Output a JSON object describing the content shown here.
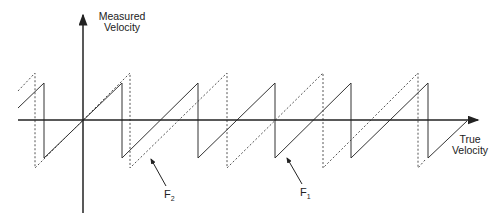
{
  "diagram": {
    "y_axis_label_line1": "Measured",
    "y_axis_label_line2": "Velocity",
    "x_axis_label_line1": "True",
    "x_axis_label_line2": "Velocity",
    "curve_f1": {
      "name": "F",
      "subscript": "1",
      "style": "solid"
    },
    "curve_f2": {
      "name": "F",
      "subscript": "2",
      "style": "dotted"
    }
  }
}
